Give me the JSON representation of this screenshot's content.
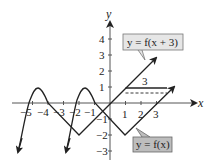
{
  "figure": {
    "x_axis_label": "x",
    "y_axis_label": "y",
    "x_ticks": [
      "−5",
      "−4",
      "−3",
      "−2",
      "−1",
      "1",
      "2",
      "3"
    ],
    "y_ticks": [
      "4",
      "3",
      "2",
      "1",
      "−1",
      "−2",
      "−3"
    ],
    "shift_label": "3",
    "label_shifted": "y = f(x + 3)",
    "label_original": "y = f(x)",
    "colors": {
      "curve": "#222222",
      "axis": "#444444",
      "label_shifted_bg": "#e6e6e6",
      "label_original_bg": "#bdbdbd"
    }
  }
}
